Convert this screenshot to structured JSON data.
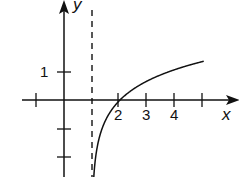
{
  "chart_data": {
    "type": "line",
    "title": "",
    "function": "y = ln(x - 1)",
    "xlabel": "x",
    "ylabel": "y",
    "x_tick_labels": [
      "2",
      "3",
      "4"
    ],
    "x_ticks": [
      -1,
      2,
      3,
      4,
      5
    ],
    "y_tick_labels": [
      "1"
    ],
    "y_ticks": [
      1,
      -1,
      -2
    ],
    "asymptote": {
      "type": "vertical",
      "x": 1,
      "style": "dashed"
    },
    "xlim": [
      -2,
      5.5
    ],
    "ylim": [
      -2.8,
      3.5
    ],
    "grid": false,
    "series": [
      {
        "name": "curve",
        "x": [
          1.05,
          1.2,
          1.5,
          2,
          2.5,
          3,
          3.5,
          4,
          4.5,
          5
        ],
        "y": [
          -3.0,
          -1.61,
          -0.69,
          0,
          0.41,
          0.69,
          0.92,
          1.1,
          1.25,
          1.39
        ]
      }
    ],
    "color": "#111111"
  },
  "labels": {
    "x": "x",
    "y": "y",
    "x2": "2",
    "x3": "3",
    "x4": "4",
    "y1": "1"
  }
}
